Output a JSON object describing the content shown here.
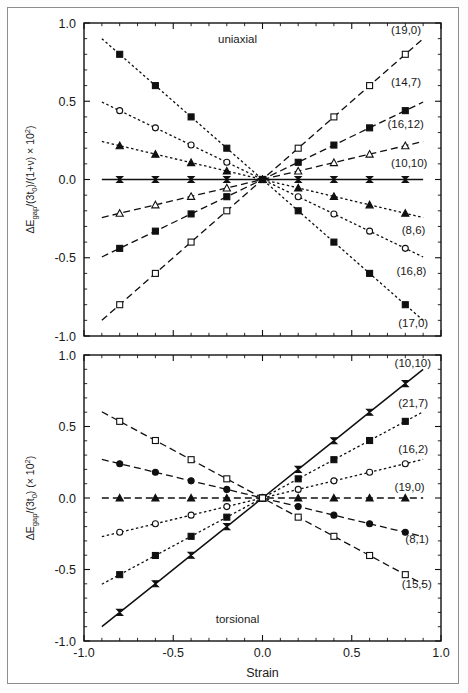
{
  "figure": {
    "x_axis_title": "Strain",
    "x_ticks": [
      "-1.0",
      "-0.5",
      "0.0",
      "0.5",
      "1.0"
    ],
    "x_tick_values": [
      -1.0,
      -0.5,
      0.0,
      0.5,
      1.0
    ],
    "y_ticks": [
      "1.0",
      "0.5",
      "0.0",
      "-0.5",
      "-1.0"
    ],
    "y_tick_values": [
      1.0,
      0.5,
      0.0,
      -0.5,
      -1.0
    ]
  },
  "chart_data": [
    {
      "type": "line",
      "panel": "top",
      "title": "uniaxial",
      "annotation": "uniaxial",
      "xlabel": "",
      "ylabel": "ΔEgap/(3t0)/(1+ν) × 10²",
      "ylabel_parts": {
        "delta_e": "ΔE",
        "gap_sub": "gap",
        "mid": "/(3t",
        "zero_sub": "0",
        "tail": ")/(1+ν) × 10",
        "exp": "2",
        "close": ")"
      },
      "xlim": [
        -1.0,
        1.0
      ],
      "ylim": [
        -1.0,
        1.0
      ],
      "grid": false,
      "legend_position": "right-inline",
      "x": [
        -0.9,
        -0.8,
        -0.6,
        -0.4,
        -0.2,
        0.0,
        0.2,
        0.4,
        0.6,
        0.8,
        0.9
      ],
      "series": [
        {
          "name": "(19,0)",
          "label": "(19,0)",
          "marker": "open-square",
          "linestyle": "dashed",
          "slope": 1.0,
          "values": [
            -0.9,
            -0.8,
            -0.6,
            -0.4,
            -0.2,
            0.0,
            0.2,
            0.4,
            0.6,
            0.8,
            0.9
          ],
          "label_x": 0.72,
          "label_y": 0.955
        },
        {
          "name": "(14,7)",
          "label": "(14,7)",
          "marker": "filled-square",
          "linestyle": "dashed",
          "slope": 0.55,
          "values": [
            -0.495,
            -0.44,
            -0.33,
            -0.22,
            -0.11,
            0.0,
            0.11,
            0.22,
            0.33,
            0.44,
            0.495
          ],
          "label_x": 0.72,
          "label_y": 0.62
        },
        {
          "name": "(16,12)",
          "label": "(16,12)",
          "marker": "open-triangle",
          "linestyle": "dashed",
          "slope": 0.27,
          "values": [
            -0.243,
            -0.216,
            -0.162,
            -0.108,
            -0.054,
            0.0,
            0.054,
            0.108,
            0.162,
            0.216,
            0.243
          ],
          "label_x": 0.7,
          "label_y": 0.355
        },
        {
          "name": "(10,10)",
          "label": "(10,10)",
          "marker": "bowtie",
          "linestyle": "solid",
          "slope": 0.0,
          "values": [
            0.0,
            0.0,
            0.0,
            0.0,
            0.0,
            0.0,
            0.0,
            0.0,
            0.0,
            0.0,
            0.0
          ],
          "label_x": 0.72,
          "label_y": 0.105
        },
        {
          "name": "(8,6)",
          "label": "(8,6)",
          "marker": "filled-triangle",
          "linestyle": "dotted",
          "slope": -0.27,
          "values": [
            0.243,
            0.216,
            0.162,
            0.108,
            0.054,
            0.0,
            -0.054,
            -0.108,
            -0.162,
            -0.216,
            -0.243
          ],
          "label_x": 0.78,
          "label_y": -0.325
        },
        {
          "name": "(16,8)",
          "label": "(16,8)",
          "marker": "open-circle",
          "linestyle": "dotted",
          "slope": -0.55,
          "values": [
            0.495,
            0.44,
            0.33,
            0.22,
            0.11,
            0.0,
            -0.11,
            -0.22,
            -0.33,
            -0.44,
            -0.495
          ],
          "label_x": 0.75,
          "label_y": -0.585
        },
        {
          "name": "(17,0)",
          "label": "(17,0)",
          "marker": "filled-square",
          "linestyle": "dotted",
          "slope": -1.0,
          "values": [
            0.9,
            0.8,
            0.6,
            0.4,
            0.2,
            0.0,
            -0.2,
            -0.4,
            -0.6,
            -0.8,
            -0.9
          ],
          "label_x": 0.76,
          "label_y": -0.915
        }
      ]
    },
    {
      "type": "line",
      "panel": "bottom",
      "title": "torsional",
      "annotation": "torsional",
      "xlabel": "Strain",
      "ylabel": "ΔEgap/(3t0) (× 10²)",
      "ylabel_parts": {
        "delta_e": "ΔE",
        "gap_sub": "gap",
        "mid": "/(3t",
        "zero_sub": "0",
        "tail": ") (× 10",
        "exp": "2",
        "close": ")"
      },
      "xlim": [
        -1.0,
        1.0
      ],
      "ylim": [
        -1.0,
        1.0
      ],
      "grid": false,
      "legend_position": "right-inline",
      "x": [
        -0.9,
        -0.8,
        -0.6,
        -0.4,
        -0.2,
        0.0,
        0.2,
        0.4,
        0.6,
        0.8,
        0.9
      ],
      "series": [
        {
          "name": "(10,10)",
          "label": "(10,10)",
          "marker": "bowtie",
          "linestyle": "solid",
          "slope": 1.0,
          "values": [
            -0.9,
            -0.8,
            -0.6,
            -0.4,
            -0.2,
            0.0,
            0.2,
            0.4,
            0.6,
            0.8,
            0.9
          ],
          "label_x": 0.74,
          "label_y": 0.945
        },
        {
          "name": "(21,7)",
          "label": "(21,7)",
          "marker": "filled-square",
          "linestyle": "dotted",
          "slope": 0.67,
          "values": [
            -0.603,
            -0.536,
            -0.402,
            -0.268,
            -0.134,
            0.0,
            0.134,
            0.268,
            0.402,
            0.536,
            0.603
          ],
          "label_x": 0.76,
          "label_y": 0.665
        },
        {
          "name": "(16,2)",
          "label": "(16,2)",
          "marker": "open-circle",
          "linestyle": "dotted",
          "slope": 0.3,
          "values": [
            -0.27,
            -0.24,
            -0.18,
            -0.12,
            -0.06,
            0.0,
            0.06,
            0.12,
            0.18,
            0.24,
            0.27
          ],
          "label_x": 0.76,
          "label_y": 0.345
        },
        {
          "name": "(19,0)",
          "label": "(19,0)",
          "marker": "filled-triangle",
          "linestyle": "dashed",
          "slope": 0.0,
          "values": [
            0.0,
            0.0,
            0.0,
            0.0,
            0.0,
            0.0,
            0.0,
            0.0,
            0.0,
            0.0,
            0.0
          ],
          "label_x": 0.74,
          "label_y": 0.075
        },
        {
          "name": "(8,1)",
          "label": "(8,1)",
          "marker": "filled-circle",
          "linestyle": "dashed",
          "slope": -0.3,
          "values": [
            0.27,
            0.24,
            0.18,
            0.12,
            0.06,
            0.0,
            -0.06,
            -0.12,
            -0.18,
            -0.24,
            -0.27
          ],
          "label_x": 0.8,
          "label_y": -0.29
        },
        {
          "name": "(15,5)",
          "label": "(15,5)",
          "marker": "open-square",
          "linestyle": "dashed",
          "slope": -0.67,
          "values": [
            0.603,
            0.536,
            0.402,
            0.268,
            0.134,
            0.0,
            -0.134,
            -0.268,
            -0.402,
            -0.536,
            -0.603
          ],
          "label_x": 0.78,
          "label_y": -0.6
        }
      ]
    }
  ]
}
